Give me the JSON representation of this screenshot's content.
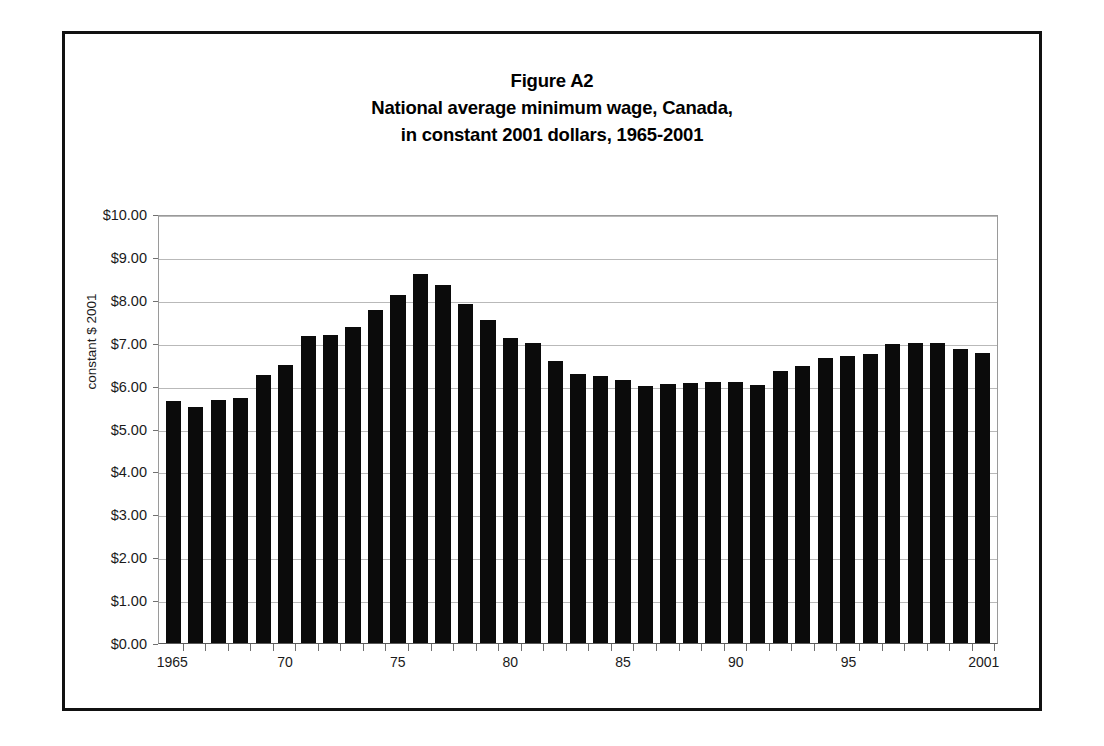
{
  "figure": {
    "title_lines": [
      "Figure A2",
      "National average minimum wage, Canada,",
      "in constant 2001 dollars, 1965-2001"
    ]
  },
  "axes": {
    "y_title": "constant $ 2001",
    "y_ticks": [
      "$0.00",
      "$1.00",
      "$2.00",
      "$3.00",
      "$4.00",
      "$5.00",
      "$6.00",
      "$7.00",
      "$8.00",
      "$9.00",
      "$10.00"
    ],
    "x_ticks": [
      "1965",
      "70",
      "75",
      "80",
      "85",
      "90",
      "95",
      "2001"
    ]
  },
  "chart_data": {
    "type": "bar",
    "xlabel": "",
    "ylabel": "constant $ 2001",
    "ylim": [
      0,
      10
    ],
    "ytick_step": 1,
    "grid": true,
    "legend": false,
    "bar_color": "#0b0b0b",
    "categories": [
      "1965",
      "1966",
      "1967",
      "1968",
      "1969",
      "1970",
      "1971",
      "1972",
      "1973",
      "1974",
      "1975",
      "1976",
      "1977",
      "1978",
      "1979",
      "1980",
      "1981",
      "1982",
      "1983",
      "1984",
      "1985",
      "1986",
      "1987",
      "1988",
      "1989",
      "1990",
      "1991",
      "1992",
      "1993",
      "1994",
      "1995",
      "1996",
      "1997",
      "1998",
      "1999",
      "2000",
      "2001"
    ],
    "values": [
      5.63,
      5.5,
      5.66,
      5.72,
      6.25,
      6.49,
      7.15,
      7.18,
      7.37,
      7.77,
      8.12,
      8.6,
      8.34,
      7.9,
      7.54,
      7.11,
      7.0,
      6.58,
      6.27,
      6.23,
      6.14,
      6.0,
      6.04,
      6.06,
      6.08,
      6.09,
      6.02,
      6.35,
      6.46,
      6.64,
      6.68,
      6.74,
      6.98,
      6.99,
      6.99,
      6.85,
      6.77
    ],
    "xtick_labels": {
      "1965": "1965",
      "1970": "70",
      "1975": "75",
      "1980": "80",
      "1985": "85",
      "1990": "90",
      "1995": "95",
      "2001": "2001"
    }
  }
}
